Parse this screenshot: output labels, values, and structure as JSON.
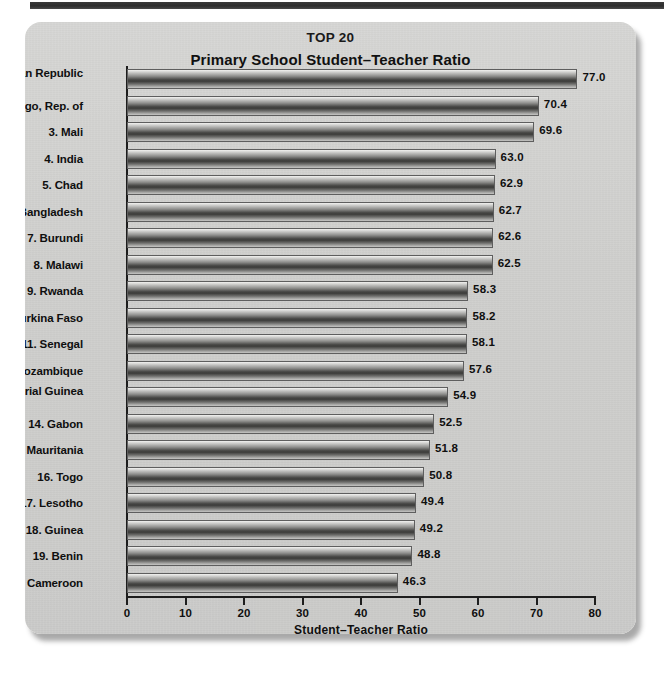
{
  "chart_data": {
    "type": "bar",
    "orientation": "horizontal",
    "suptitle": "TOP 20",
    "title": "Primary School Student–Teacher Ratio",
    "xlabel": "Student–Teacher Ratio",
    "ylabel": "",
    "xlim": [
      0,
      80
    ],
    "xticks": [
      "0",
      "10",
      "20",
      "30",
      "40",
      "50",
      "60",
      "70",
      "80"
    ],
    "xtick_values": [
      0,
      10,
      20,
      30,
      40,
      50,
      60,
      70,
      80
    ],
    "grid": false,
    "legend": null,
    "categories": [
      "1. Central African Republic",
      "2. Congo, Rep. of",
      "3. Mali",
      "4. India",
      "5. Chad",
      "6. Bangladesh",
      "7. Burundi",
      "8. Malawi",
      "9. Rwanda",
      "10. Burkina Faso",
      "11. Senegal",
      "12. Mozambique",
      "13. Equatorial Guinea",
      "14. Gabon",
      "15. Mauritania",
      "16. Togo",
      "17. Lesotho",
      "18. Guinea",
      "19. Benin",
      "20. Cameroon"
    ],
    "values": [
      77.0,
      70.4,
      69.6,
      63.0,
      62.9,
      62.7,
      62.6,
      62.5,
      58.3,
      58.2,
      58.1,
      57.6,
      54.9,
      52.5,
      51.8,
      50.8,
      49.4,
      49.2,
      48.8,
      46.3
    ],
    "value_labels": [
      "77.0",
      "70.4",
      "69.6",
      "63.0",
      "62.9",
      "62.7",
      "62.6",
      "62.5",
      "58.3",
      "58.2",
      "58.1",
      "57.6",
      "54.9",
      "52.5",
      "51.8",
      "50.8",
      "49.4",
      "49.2",
      "48.8",
      "46.3"
    ]
  },
  "colors": {
    "panel_background": "#d2d2d0",
    "bar_dark": "#3b3b39",
    "bar_light": "#f2f2f0",
    "axis": "#1d1d1d",
    "text": "#0f0f0f",
    "top_rule": "#2e2e2e"
  }
}
